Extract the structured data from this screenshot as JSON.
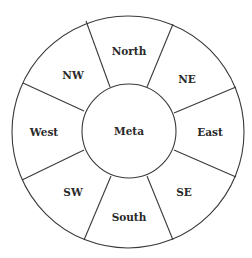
{
  "diagram": {
    "type": "compass-rose-ring",
    "center_label": "Meta",
    "segments": [
      {
        "direction": "North",
        "label": "North"
      },
      {
        "direction": "NE",
        "label": "NE"
      },
      {
        "direction": "East",
        "label": "East"
      },
      {
        "direction": "SE",
        "label": "SE"
      },
      {
        "direction": "South",
        "label": "South"
      },
      {
        "direction": "SW",
        "label": "SW"
      },
      {
        "direction": "West",
        "label": "West"
      },
      {
        "direction": "NW",
        "label": "NW"
      }
    ],
    "colors": {
      "stroke": "#3a3a3a",
      "text": "#2a2a2a",
      "background": "#ffffff"
    }
  }
}
